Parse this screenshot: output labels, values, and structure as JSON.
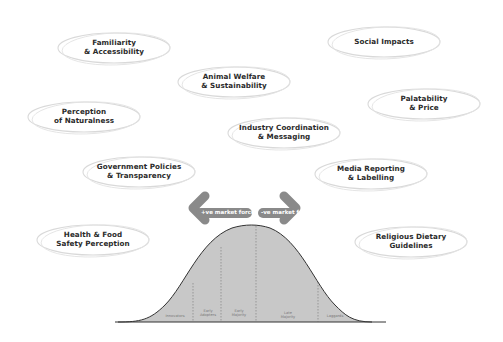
{
  "bubbles": [
    {
      "label": "Familiarity\n& Accessibility",
      "x": 55,
      "y": 28,
      "w": 118,
      "h": 40
    },
    {
      "label": "Social Impacts",
      "x": 325,
      "y": 22,
      "w": 118,
      "h": 40
    },
    {
      "label": "Animal Welfare\n& Sustainability",
      "x": 175,
      "y": 62,
      "w": 118,
      "h": 40
    },
    {
      "label": "Perception\nof Naturalness",
      "x": 25,
      "y": 97,
      "w": 118,
      "h": 40
    },
    {
      "label": "Palatability\n& Price",
      "x": 365,
      "y": 84,
      "w": 118,
      "h": 40
    },
    {
      "label": "Industry Coordination\n& Messaging",
      "x": 225,
      "y": 113,
      "w": 118,
      "h": 40
    },
    {
      "label": "Government Policies\n& Transparency",
      "x": 80,
      "y": 152,
      "w": 118,
      "h": 40
    },
    {
      "label": "Media Reporting\n& Labelling",
      "x": 312,
      "y": 154,
      "w": 118,
      "h": 40
    },
    {
      "label": "Health & Food\nSafety Perception",
      "x": 34,
      "y": 220,
      "w": 118,
      "h": 40
    },
    {
      "label": "Religious Dietary\nGuidelines",
      "x": 352,
      "y": 222,
      "w": 118,
      "h": 40
    }
  ],
  "arrows": {
    "left_label": "+ve market force",
    "right_label": "-ve market force",
    "color": "#8a8a8a"
  },
  "curve": {
    "fill": "#c8c8c8",
    "stroke": "#333333",
    "segments": [
      {
        "label": "Innovators"
      },
      {
        "label": "Early\nAdopters"
      },
      {
        "label": "Early\nMajority"
      },
      {
        "label": "Late\nMajority"
      },
      {
        "label": "Laggards"
      }
    ]
  }
}
